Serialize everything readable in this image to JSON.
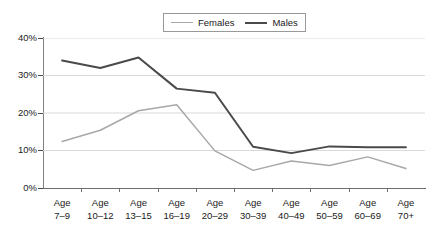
{
  "chart_data": {
    "type": "line",
    "title": "",
    "xlabel": "",
    "ylabel": "",
    "categories": [
      "Age 7–9",
      "Age 10–12",
      "Age 13–15",
      "Age 16–19",
      "Age 20–29",
      "Age 30–39",
      "Age 40–49",
      "Age 50–59",
      "Age 60–69",
      "Age 70+"
    ],
    "series": [
      {
        "name": "Females",
        "color": "#a8a8a8",
        "values": [
          12.4,
          15.4,
          20.6,
          22.2,
          9.9,
          4.7,
          7.2,
          6.0,
          8.3,
          5.2
        ]
      },
      {
        "name": "Males",
        "color": "#4a4a4a",
        "values": [
          34.0,
          32.0,
          34.8,
          26.5,
          25.4,
          11.0,
          9.3,
          11.1,
          10.9,
          10.9
        ]
      }
    ],
    "ylim": [
      0,
      40
    ],
    "ytick_values": [
      0,
      10,
      20,
      30,
      40
    ],
    "ytick_labels": [
      "0%",
      "10%",
      "20%",
      "30%",
      "40%"
    ],
    "grid": true,
    "grid_axis": "y",
    "legend_position": "top-center",
    "value_suffix": "%"
  },
  "axes": {
    "y_labels": [
      "40%",
      "30%",
      "20%",
      "10%",
      "0%"
    ]
  },
  "x_axis": {
    "labels": [
      {
        "line1": "Age",
        "line2": "7–9"
      },
      {
        "line1": "Age",
        "line2": "10–12"
      },
      {
        "line1": "Age",
        "line2": "13–15"
      },
      {
        "line1": "Age",
        "line2": "16–19"
      },
      {
        "line1": "Age",
        "line2": "20–29"
      },
      {
        "line1": "Age",
        "line2": "30–39"
      },
      {
        "line1": "Age",
        "line2": "40–49"
      },
      {
        "line1": "Age",
        "line2": "50–59"
      },
      {
        "line1": "Age",
        "line2": "60–69"
      },
      {
        "line1": "Age",
        "line2": "70+"
      }
    ]
  },
  "legend": {
    "entries": [
      {
        "label": "Females",
        "color": "#a8a8a8"
      },
      {
        "label": "Males",
        "color": "#4a4a4a"
      }
    ]
  },
  "style": {
    "grid_color": "#d9d9d9",
    "axis_color": "#808080",
    "text_color": "#1a1a1a",
    "background": "#ffffff"
  }
}
